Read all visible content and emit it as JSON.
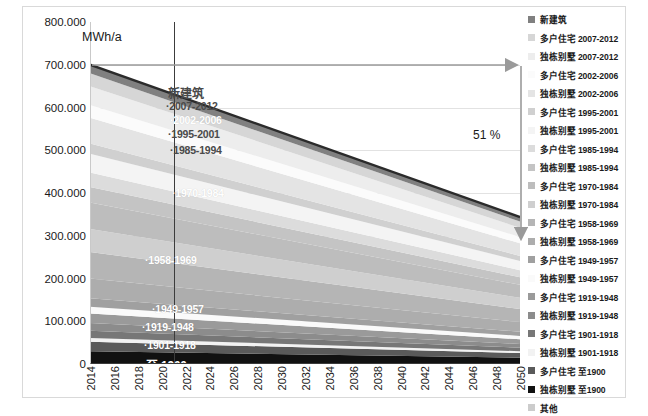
{
  "axes": {
    "y_unit_label": "MWh/a",
    "y_ticks": [
      "800.000",
      "700.000",
      "600.000",
      "500.000",
      "400.000",
      "300.000",
      "200.000",
      "100.000",
      "0"
    ],
    "x_ticks": [
      "2014",
      "2016",
      "2018",
      "2020",
      "2022",
      "2024",
      "2026",
      "2028",
      "2030",
      "2032",
      "2034",
      "2036",
      "2038",
      "2040",
      "2042",
      "2044",
      "2046",
      "2048",
      "2050"
    ]
  },
  "annotation": {
    "reduction_label": "51 %"
  },
  "band_labels": [
    {
      "text": "新建筑"
    },
    {
      "text": "2007-2012"
    },
    {
      "text": "2002-2006"
    },
    {
      "text": "1995-2001"
    },
    {
      "text": "1985-1994"
    },
    {
      "text": "1970-1984"
    },
    {
      "text": "1958-1969"
    },
    {
      "text": "1949-1957"
    },
    {
      "text": "1919-1948"
    },
    {
      "text": "1901-1918"
    },
    {
      "text": "至 1900"
    }
  ],
  "legend": {
    "items": [
      {
        "label": "新建筑",
        "color": "#808080"
      },
      {
        "label": "多户住宅 2007-2012",
        "color": "#d6d6d6"
      },
      {
        "label": "独栋别墅 2007-2012",
        "color": "#ededed"
      },
      {
        "label": "多户住宅 2002-2006",
        "color": "#fbfbfb"
      },
      {
        "label": "独栋别墅 2002-2006",
        "color": "#e4e4e4"
      },
      {
        "label": "多户住宅 1995-2001",
        "color": "#d0d0d0"
      },
      {
        "label": "独栋别墅 1995-2001",
        "color": "#f4f4f4"
      },
      {
        "label": "多户住宅 1985-1994",
        "color": "#dcdcdc"
      },
      {
        "label": "独栋别墅 1985-1994",
        "color": "#c4c4c4"
      },
      {
        "label": "多户住宅 1970-1984",
        "color": "#bdbdbd"
      },
      {
        "label": "独栋别墅 1970-1984",
        "color": "#cfcfcf"
      },
      {
        "label": "多户住宅 1958-1969",
        "color": "#b5b5b5"
      },
      {
        "label": "独栋别墅 1958-1969",
        "color": "#adadad"
      },
      {
        "label": "多户住宅 1949-1957",
        "color": "#a0a0a0"
      },
      {
        "label": "独栋别墅 1949-1957",
        "color": "#fafafa"
      },
      {
        "label": "多户住宅 1919-1948",
        "color": "#9a9a9a"
      },
      {
        "label": "独栋别墅 1919-1948",
        "color": "#8c8c8c"
      },
      {
        "label": "多户住宅 1901-1918",
        "color": "#777777"
      },
      {
        "label": "独栋别墅 1901-1918",
        "color": "#f2f2f2"
      },
      {
        "label": "多户住宅 至1900",
        "color": "#5a5a5a"
      },
      {
        "label": "独栋别墅 至1900",
        "color": "#111111"
      },
      {
        "label": "其他",
        "color": "#cccccc"
      }
    ]
  },
  "chart_data": {
    "type": "area",
    "title": "",
    "xlabel": "",
    "ylabel": "MWh/a",
    "ylim": [
      0,
      800000
    ],
    "xlim": [
      2014,
      2050
    ],
    "grid": true,
    "legend_position": "right",
    "stacked": true,
    "x": [
      2014,
      2050
    ],
    "total_at_start": 700000,
    "total_at_end": 343000,
    "reduction_percent": 51,
    "reference_year_line": 2021,
    "series": [
      {
        "name": "独栋别墅 至1900",
        "color": "#111111",
        "values": [
          30000,
          14700
        ]
      },
      {
        "name": "多户住宅 至1900",
        "color": "#5a5a5a",
        "values": [
          22000,
          10780
        ]
      },
      {
        "name": "独栋别墅 1901-1918",
        "color": "#f2f2f2",
        "values": [
          9000,
          4410
        ]
      },
      {
        "name": "多户住宅 1901-1918",
        "color": "#777777",
        "values": [
          17000,
          8330
        ]
      },
      {
        "name": "独栋别墅 1919-1948",
        "color": "#8c8c8c",
        "values": [
          18000,
          8820
        ]
      },
      {
        "name": "多户住宅 1919-1948",
        "color": "#9a9a9a",
        "values": [
          22000,
          10780
        ]
      },
      {
        "name": "独栋别墅 1949-1957",
        "color": "#fafafa",
        "values": [
          16000,
          7840
        ]
      },
      {
        "name": "多户住宅 1949-1957",
        "color": "#a0a0a0",
        "values": [
          20000,
          9800
        ]
      },
      {
        "name": "独栋别墅 1958-1969",
        "color": "#adadad",
        "values": [
          46000,
          22540
        ]
      },
      {
        "name": "多户住宅 1958-1969",
        "color": "#b5b5b5",
        "values": [
          62000,
          30380
        ]
      },
      {
        "name": "独栋别墅 1970-1984",
        "color": "#cfcfcf",
        "values": [
          54000,
          26460
        ]
      },
      {
        "name": "多户住宅 1970-1984",
        "color": "#bdbdbd",
        "values": [
          62000,
          30380
        ]
      },
      {
        "name": "独栋别墅 1985-1994",
        "color": "#c4c4c4",
        "values": [
          36000,
          17640
        ]
      },
      {
        "name": "多户住宅 1985-1994",
        "color": "#dcdcdc",
        "values": [
          34000,
          16660
        ]
      },
      {
        "name": "独栋别墅 1995-2001",
        "color": "#f4f4f4",
        "values": [
          44000,
          21560
        ]
      },
      {
        "name": "多户住宅 1995-2001",
        "color": "#d0d0d0",
        "values": [
          24000,
          11760
        ]
      },
      {
        "name": "独栋别墅 2002-2006",
        "color": "#e4e4e4",
        "values": [
          60000,
          29400
        ]
      },
      {
        "name": "多户住宅 2002-2006",
        "color": "#fbfbfb",
        "values": [
          30000,
          14700
        ]
      },
      {
        "name": "独栋别墅 2007-2012",
        "color": "#ededed",
        "values": [
          44000,
          21560
        ]
      },
      {
        "name": "多户住宅 2007-2012",
        "color": "#d6d6d6",
        "values": [
          30000,
          14700
        ]
      },
      {
        "name": "新建筑",
        "color": "#808080",
        "values": [
          20000,
          10600
        ]
      }
    ]
  }
}
